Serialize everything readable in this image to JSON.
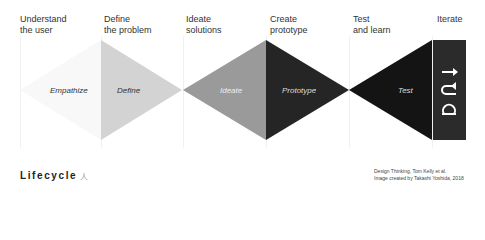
{
  "stages": [
    {
      "heading": [
        "Understand",
        "the user"
      ],
      "shape_label": "Empathize",
      "color": "#fafafa",
      "label_color": "#333333"
    },
    {
      "heading": [
        "Define",
        "the problem"
      ],
      "shape_label": "Define",
      "color": "#d3d3d3",
      "label_color": "#333333"
    },
    {
      "heading": [
        "Ideate",
        "solutions"
      ],
      "shape_label": "Ideate",
      "color": "#9a9a9a",
      "label_color": "#eeeeee"
    },
    {
      "heading": [
        "Create",
        "prototype"
      ],
      "shape_label": "Prototype",
      "color": "#252525",
      "label_color": "#dddddd"
    },
    {
      "heading": [
        "Test",
        "and learn"
      ],
      "shape_label": "Test",
      "color": "#141414",
      "label_color": "#dddddd"
    },
    {
      "heading": [
        "Iterate"
      ],
      "shape_label": "",
      "color": "#2b2b2b",
      "label_color": "#ffffff"
    }
  ],
  "iterate_icons": [
    "arrow-right-icon",
    "return-loop-icon",
    "loop-icon"
  ],
  "footer": {
    "title": "Lifecycle",
    "glyph": "人",
    "credit_line_1": "Design Thinking, Tom Kelly et al.",
    "credit_line_2": "Image created by Takashi Yoshida, 2018"
  }
}
